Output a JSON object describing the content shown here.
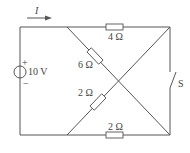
{
  "diagram": {
    "type": "circuit",
    "current_label": "I",
    "source": {
      "label": "10 V",
      "plus": "+",
      "minus": "−"
    },
    "resistors": {
      "top": "4 Ω",
      "bottom": "2 Ω",
      "diag_upper": "6 Ω",
      "diag_lower": "2 Ω"
    },
    "switch_label": "S",
    "colors": {
      "line": "#555555",
      "text": "#444444",
      "background": "#ffffff"
    }
  }
}
